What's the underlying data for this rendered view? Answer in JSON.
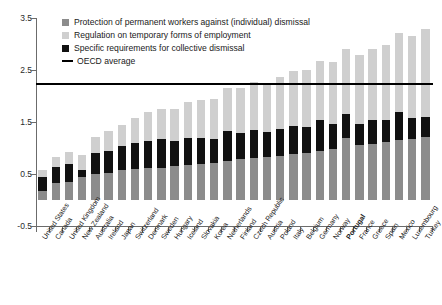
{
  "chart_data": {
    "type": "bar",
    "title": "",
    "xlabel": "",
    "ylabel": "",
    "ylim": [
      -0.5,
      3.5
    ],
    "yticks": [
      3.5,
      2.5,
      1.5,
      0.5,
      -0.5
    ],
    "ytick_labels": [
      "3.5",
      "2.5",
      "1.5",
      "0.5",
      "-0.5"
    ],
    "grid": false,
    "stacked": true,
    "legend_position": "top-left",
    "categories": [
      "United States",
      "Canada",
      "United Kingdom",
      "New Zealand",
      "Australia",
      "Ireland",
      "Japan",
      "Switzerland",
      "Denmark",
      "Sweden",
      "Hungary",
      "Iceland",
      "Slovakia",
      "Korea",
      "Netherlands",
      "Finland",
      "Czech Republic",
      "Austria",
      "Poland",
      "Italy",
      "Belgium",
      "Germany",
      "Norway",
      "Portugal",
      "France",
      "Greece",
      "Spain",
      "Mexico",
      "Luxembourg",
      "Turkey"
    ],
    "highlight_category": "Portugal",
    "series": [
      {
        "name": "Protection of permanent workers against (individual) dismissal",
        "color": "#8c8c8c",
        "values": [
          0.17,
          0.32,
          0.35,
          0.44,
          0.5,
          0.52,
          0.58,
          0.6,
          0.62,
          0.62,
          0.65,
          0.68,
          0.7,
          0.72,
          0.75,
          0.78,
          0.8,
          0.82,
          0.85,
          0.88,
          0.9,
          0.95,
          0.98,
          1.2,
          1.05,
          1.08,
          1.12,
          1.15,
          1.18,
          1.22
        ]
      },
      {
        "name": "Regulation on temporary forms of employment",
        "color": "#cfcfcf",
        "values": [
          0.12,
          0.18,
          0.22,
          0.28,
          0.32,
          0.38,
          0.42,
          0.48,
          0.55,
          0.58,
          0.62,
          0.68,
          0.72,
          0.78,
          0.82,
          0.88,
          0.92,
          0.95,
          1.0,
          1.05,
          1.1,
          1.15,
          1.2,
          1.25,
          1.32,
          1.38,
          1.45,
          1.52,
          1.58,
          1.68
        ]
      },
      {
        "name": "Specific requirements for collective dismissal",
        "color": "#111111",
        "values": [
          0.28,
          0.32,
          0.35,
          0.14,
          0.4,
          0.42,
          0.45,
          0.5,
          0.52,
          0.55,
          0.48,
          0.52,
          0.5,
          0.45,
          0.58,
          0.5,
          0.55,
          0.48,
          0.52,
          0.55,
          0.5,
          0.58,
          0.48,
          0.45,
          0.42,
          0.45,
          0.42,
          0.55,
          0.4,
          0.38
        ]
      }
    ],
    "totals": [
      0.57,
      0.82,
      0.92,
      0.86,
      1.22,
      1.32,
      1.45,
      1.58,
      1.69,
      1.75,
      1.75,
      1.88,
      1.92,
      1.95,
      2.15,
      2.16,
      2.27,
      2.25,
      2.37,
      2.48,
      2.5,
      2.68,
      2.66,
      2.9,
      2.79,
      2.91,
      2.99,
      3.22,
      3.16,
      3.28
    ],
    "oecd_average": {
      "label": "OECD average",
      "value": 2.25,
      "color": "#000000"
    }
  },
  "legend": {
    "items": [
      {
        "label": "Protection of permanent workers against (individual) dismissal",
        "swatch": "gray-swatch"
      },
      {
        "label": "Regulation on temporary forms of employment",
        "swatch": "light-gray-swatch"
      },
      {
        "label": "Specific requirements for collective dismissal",
        "swatch": "black-swatch"
      },
      {
        "label": "OECD average",
        "swatch": "black-rule"
      }
    ]
  }
}
